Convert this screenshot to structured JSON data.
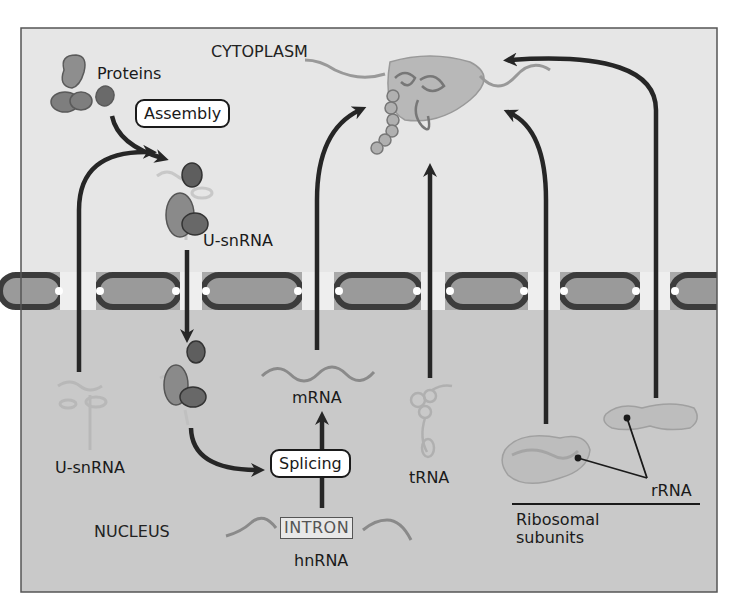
{
  "regions": {
    "cytoplasm": "CYTOPLASM",
    "nucleus": "NUCLEUS"
  },
  "steps": {
    "assembly": "Assembly",
    "splicing": "Splicing"
  },
  "molecules": {
    "proteins": "Proteins",
    "usnrna_cytoplasm": "U-snRNA",
    "usnrna_nucleus": "U-snRNA",
    "mrna": "mRNA",
    "trna": "tRNA",
    "rrna": "rRNA",
    "hnrna": "hnRNA",
    "intron": "INTRON",
    "ribosomal_line1": "Ribosomal",
    "ribosomal_line2": "subunits"
  },
  "colors": {
    "cytoplasm_bg": "#e6e6e6",
    "nucleus_bg": "#c9c9c9",
    "membrane": "#9a9a9a",
    "pore_outline": "#3c3c3c",
    "arrow": "#262626",
    "protein_light": "#8e8e8e",
    "protein_dark": "#5a5a5a",
    "rna_strand": "#a8a8a8"
  }
}
